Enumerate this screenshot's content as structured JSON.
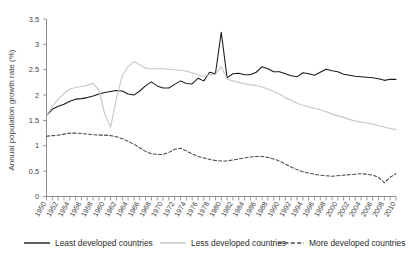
{
  "chart_data": {
    "type": "line",
    "title": "",
    "xlabel": "",
    "ylabel": "Annual population growth rate (%)",
    "ylim": [
      0,
      3.5
    ],
    "ytick_labels": [
      "0",
      "0.5",
      "1",
      "1.5",
      "2",
      "2.5",
      "3",
      "3.5"
    ],
    "ytick_values": [
      0,
      0.5,
      1,
      1.5,
      2,
      2.5,
      3,
      3.5
    ],
    "grid": false,
    "legend_position": "bottom",
    "xlim": [
      1950,
      2010
    ],
    "x": [
      1950,
      1951,
      1952,
      1953,
      1954,
      1955,
      1956,
      1957,
      1958,
      1959,
      1960,
      1961,
      1962,
      1963,
      1964,
      1965,
      1966,
      1967,
      1968,
      1969,
      1970,
      1971,
      1972,
      1973,
      1974,
      1975,
      1976,
      1977,
      1978,
      1979,
      1980,
      1981,
      1982,
      1983,
      1984,
      1985,
      1986,
      1987,
      1988,
      1989,
      1990,
      1991,
      1992,
      1993,
      1994,
      1995,
      1996,
      1997,
      1998,
      1999,
      2000,
      2001,
      2002,
      2003,
      2004,
      2005,
      2006,
      2007,
      2008,
      2009,
      2010
    ],
    "xtick_labels": [
      "1950",
      "1952",
      "1954",
      "1956",
      "1958",
      "1960",
      "1962",
      "1964",
      "1966",
      "1968",
      "1970",
      "1972",
      "1974",
      "1976",
      "1978",
      "1980",
      "1982",
      "1984",
      "1986",
      "1988",
      "1990",
      "1992",
      "1994",
      "1996",
      "1998",
      "2000",
      "2002",
      "2004",
      "2006",
      "2008",
      "2010"
    ],
    "series": [
      {
        "name": "Least developed countries",
        "color": "#1a1a1a",
        "style": "solid",
        "values": [
          1.6,
          1.72,
          1.78,
          1.82,
          1.88,
          1.92,
          1.93,
          1.95,
          1.98,
          2.02,
          2.05,
          2.07,
          2.09,
          2.08,
          2.02,
          2.0,
          2.08,
          2.18,
          2.26,
          2.18,
          2.14,
          2.14,
          2.21,
          2.28,
          2.23,
          2.22,
          2.33,
          2.28,
          2.45,
          2.42,
          3.24,
          2.34,
          2.42,
          2.43,
          2.4,
          2.4,
          2.45,
          2.56,
          2.52,
          2.46,
          2.46,
          2.42,
          2.38,
          2.36,
          2.44,
          2.42,
          2.39,
          2.45,
          2.51,
          2.48,
          2.46,
          2.41,
          2.39,
          2.37,
          2.36,
          2.35,
          2.34,
          2.32,
          2.29,
          2.31,
          2.31
        ]
      },
      {
        "name": "Less developed countries",
        "color": "#c8c8c8",
        "style": "solid",
        "values": [
          1.6,
          1.77,
          1.92,
          2.03,
          2.12,
          2.15,
          2.17,
          2.19,
          2.23,
          2.1,
          1.62,
          1.37,
          1.93,
          2.38,
          2.56,
          2.66,
          2.6,
          2.53,
          2.52,
          2.52,
          2.52,
          2.51,
          2.5,
          2.49,
          2.47,
          2.44,
          2.4,
          2.37,
          2.4,
          2.41,
          2.56,
          2.32,
          2.28,
          2.25,
          2.22,
          2.2,
          2.19,
          2.16,
          2.12,
          2.07,
          2.02,
          1.95,
          1.9,
          1.84,
          1.8,
          1.77,
          1.74,
          1.71,
          1.67,
          1.63,
          1.59,
          1.56,
          1.52,
          1.49,
          1.47,
          1.45,
          1.43,
          1.4,
          1.37,
          1.34,
          1.32
        ]
      },
      {
        "name": "More developed countries",
        "color": "#4a4a4a",
        "style": "dashed",
        "values": [
          1.19,
          1.2,
          1.21,
          1.23,
          1.25,
          1.25,
          1.24,
          1.23,
          1.22,
          1.21,
          1.21,
          1.2,
          1.18,
          1.14,
          1.09,
          1.03,
          0.96,
          0.89,
          0.84,
          0.83,
          0.83,
          0.87,
          0.93,
          0.95,
          0.9,
          0.84,
          0.79,
          0.76,
          0.73,
          0.71,
          0.7,
          0.7,
          0.72,
          0.74,
          0.76,
          0.78,
          0.79,
          0.79,
          0.77,
          0.74,
          0.7,
          0.64,
          0.58,
          0.53,
          0.49,
          0.46,
          0.44,
          0.42,
          0.41,
          0.4,
          0.41,
          0.42,
          0.43,
          0.44,
          0.45,
          0.44,
          0.42,
          0.38,
          0.27,
          0.38,
          0.45
        ]
      }
    ]
  },
  "legend": {
    "items": [
      {
        "label": "Least developed countries",
        "color": "#1a1a1a",
        "style": "solid"
      },
      {
        "label": "Less developed countries",
        "color": "#c8c8c8",
        "style": "solid"
      },
      {
        "label": "More developed countries",
        "color": "#4a4a4a",
        "style": "dashed"
      }
    ]
  }
}
